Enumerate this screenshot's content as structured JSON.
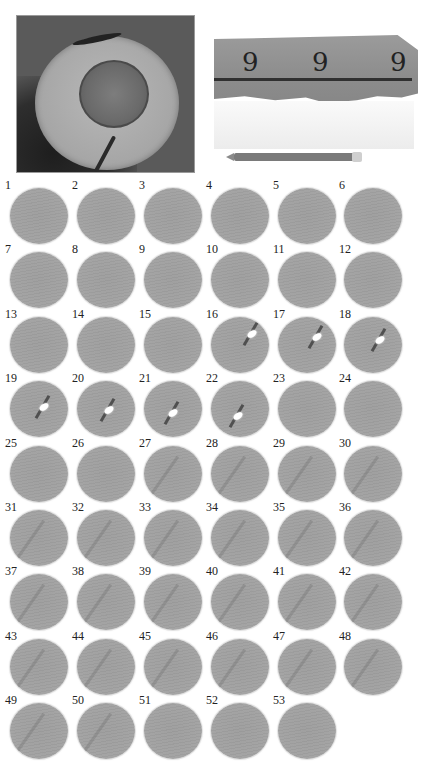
{
  "figure": {
    "photos": [
      {
        "name": "core-cross-section",
        "description": "Circular rock/ice core cross-section with darker central disk"
      },
      {
        "name": "slab-with-marks",
        "description": "Gray slab with three hand-drawn '9'-shaped marks and a horizontal line, white layer below, pencil for scale",
        "marks": [
          "9",
          "9",
          "9"
        ]
      }
    ],
    "slices": [
      {
        "n": "1",
        "feature": "none"
      },
      {
        "n": "2",
        "feature": "none"
      },
      {
        "n": "3",
        "feature": "none"
      },
      {
        "n": "4",
        "feature": "none"
      },
      {
        "n": "5",
        "feature": "none"
      },
      {
        "n": "6",
        "feature": "none"
      },
      {
        "n": "7",
        "feature": "none"
      },
      {
        "n": "8",
        "feature": "none"
      },
      {
        "n": "9",
        "feature": "none"
      },
      {
        "n": "10",
        "feature": "none"
      },
      {
        "n": "11",
        "feature": "none"
      },
      {
        "n": "12",
        "feature": "none"
      },
      {
        "n": "13",
        "feature": "none"
      },
      {
        "n": "14",
        "feature": "none"
      },
      {
        "n": "15",
        "feature": "none"
      },
      {
        "n": "16",
        "feature": "bubble"
      },
      {
        "n": "17",
        "feature": "bubble"
      },
      {
        "n": "18",
        "feature": "bubble"
      },
      {
        "n": "19",
        "feature": "bubble"
      },
      {
        "n": "20",
        "feature": "bubble"
      },
      {
        "n": "21",
        "feature": "bubble"
      },
      {
        "n": "22",
        "feature": "bubble"
      },
      {
        "n": "23",
        "feature": "none"
      },
      {
        "n": "24",
        "feature": "none"
      },
      {
        "n": "25",
        "feature": "none"
      },
      {
        "n": "26",
        "feature": "none"
      },
      {
        "n": "27",
        "feature": "faint-fracture"
      },
      {
        "n": "28",
        "feature": "faint-fracture"
      },
      {
        "n": "29",
        "feature": "faint-fracture"
      },
      {
        "n": "30",
        "feature": "faint-fracture"
      },
      {
        "n": "31",
        "feature": "faint-fracture"
      },
      {
        "n": "32",
        "feature": "faint-fracture"
      },
      {
        "n": "33",
        "feature": "faint-fracture"
      },
      {
        "n": "34",
        "feature": "faint-fracture"
      },
      {
        "n": "35",
        "feature": "faint-fracture"
      },
      {
        "n": "36",
        "feature": "faint-fracture"
      },
      {
        "n": "37",
        "feature": "faint-fracture"
      },
      {
        "n": "38",
        "feature": "faint-fracture"
      },
      {
        "n": "39",
        "feature": "faint-fracture"
      },
      {
        "n": "40",
        "feature": "faint-fracture"
      },
      {
        "n": "41",
        "feature": "faint-fracture"
      },
      {
        "n": "42",
        "feature": "faint-fracture"
      },
      {
        "n": "43",
        "feature": "faint-fracture"
      },
      {
        "n": "44",
        "feature": "faint-fracture"
      },
      {
        "n": "45",
        "feature": "faint-fracture"
      },
      {
        "n": "46",
        "feature": "faint-fracture"
      },
      {
        "n": "47",
        "feature": "faint-fracture"
      },
      {
        "n": "48",
        "feature": "faint-fracture"
      },
      {
        "n": "49",
        "feature": "faint-fracture"
      },
      {
        "n": "50",
        "feature": "faint-fracture"
      },
      {
        "n": "51",
        "feature": "none"
      },
      {
        "n": "52",
        "feature": "none"
      },
      {
        "n": "53",
        "feature": "none"
      }
    ],
    "grid": {
      "columns": 6,
      "total": 53
    },
    "colors": {
      "background": "#ffffff",
      "slice": "#a1a1a1",
      "label": "#222222"
    }
  }
}
